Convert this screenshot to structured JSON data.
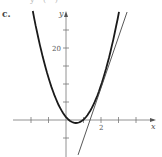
{
  "panel": {
    "label": "c.",
    "top_fragment": "y ( )"
  },
  "chart_data": {
    "type": "line",
    "title": "",
    "xlabel": "x",
    "ylabel": "y",
    "xlim": [
      -2.4,
      3.8
    ],
    "ylim": [
      -10,
      30
    ],
    "grid": false,
    "x_ticks": [
      -2,
      -1,
      0,
      1,
      2,
      3,
      4
    ],
    "x_tick_labels": [
      {
        "value": 2,
        "label": "2"
      }
    ],
    "y_ticks": [
      -5,
      0,
      5,
      10,
      15,
      20,
      25
    ],
    "y_tick_labels": [
      {
        "value": 20,
        "label": "20"
      }
    ],
    "series": [
      {
        "name": "parabola",
        "style": "thick",
        "equation_approx": "y = 5.1(x - 0.57)^2 - 0.83",
        "x": [
          -1.9,
          -1.5,
          -1.0,
          -0.5,
          0,
          0.57,
          1.0,
          1.5,
          2.0,
          2.5,
          3.03
        ],
        "y": [
          30.3,
          21.0,
          11.7,
          5.0,
          0.8,
          -0.83,
          0.1,
          3.6,
          9.6,
          18.2,
          30.0
        ]
      },
      {
        "name": "tangent line",
        "style": "thin",
        "x": [
          0.69,
          3.49
        ],
        "y": [
          -9.7,
          30.0
        ]
      }
    ]
  }
}
